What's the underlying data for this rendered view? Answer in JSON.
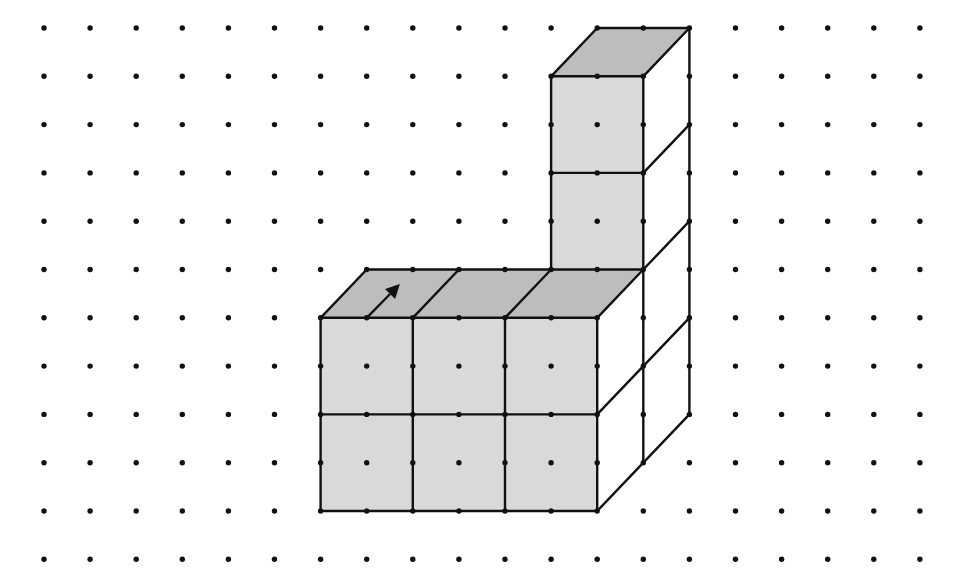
{
  "diagram": {
    "grid": {
      "origin_x": 44,
      "origin_y": 28,
      "col_spacing": 46.1,
      "row_spacing": 48.3,
      "cols": 20,
      "rows": 12,
      "dot_radius": 2.7,
      "dot_color": "#111111"
    },
    "colors": {
      "front_face": "#d9d9d9",
      "top_face": "#bdbdbd",
      "side_face": "#ffffff",
      "line": "#111111",
      "background": "#ffffff"
    },
    "line_width": 2.4,
    "polygons": [
      {
        "name": "column-top-face",
        "fill": "top_face",
        "points": [
          [
            12,
            0
          ],
          [
            14,
            0
          ],
          [
            13,
            1
          ],
          [
            11,
            1
          ]
        ]
      },
      {
        "name": "column-front-face",
        "fill": "front_face",
        "points": [
          [
            11,
            1
          ],
          [
            13,
            1
          ],
          [
            13,
            5
          ],
          [
            11,
            5
          ]
        ]
      },
      {
        "name": "column-right-face",
        "fill": "side_face",
        "points": [
          [
            13,
            1
          ],
          [
            14,
            0
          ],
          [
            14,
            8
          ],
          [
            13,
            9
          ]
        ]
      },
      {
        "name": "block-top-face",
        "fill": "top_face",
        "points": [
          [
            7,
            5
          ],
          [
            13,
            5
          ],
          [
            12,
            6
          ],
          [
            6,
            6
          ]
        ]
      },
      {
        "name": "block-front-face",
        "fill": "front_face",
        "points": [
          [
            6,
            6
          ],
          [
            12,
            6
          ],
          [
            12,
            10
          ],
          [
            6,
            10
          ]
        ]
      },
      {
        "name": "block-right-face",
        "fill": "side_face",
        "points": [
          [
            12,
            6
          ],
          [
            13,
            5
          ],
          [
            14,
            4
          ],
          [
            14,
            8
          ],
          [
            12,
            10
          ]
        ]
      }
    ],
    "lines": [
      [
        [
          12,
          0
        ],
        [
          14,
          0
        ]
      ],
      [
        [
          12,
          0
        ],
        [
          11,
          1
        ]
      ],
      [
        [
          14,
          0
        ],
        [
          13,
          1
        ]
      ],
      [
        [
          11,
          1
        ],
        [
          13,
          1
        ]
      ],
      [
        [
          11,
          1
        ],
        [
          11,
          5
        ]
      ],
      [
        [
          13,
          1
        ],
        [
          13,
          9
        ]
      ],
      [
        [
          14,
          0
        ],
        [
          14,
          8
        ]
      ],
      [
        [
          11,
          3
        ],
        [
          13,
          3
        ]
      ],
      [
        [
          13,
          3
        ],
        [
          14,
          2
        ]
      ],
      [
        [
          13,
          5
        ],
        [
          14,
          4
        ]
      ],
      [
        [
          7,
          5
        ],
        [
          13,
          5
        ]
      ],
      [
        [
          7,
          5
        ],
        [
          6,
          6
        ]
      ],
      [
        [
          9,
          5
        ],
        [
          8,
          6
        ]
      ],
      [
        [
          11,
          5
        ],
        [
          10,
          6
        ]
      ],
      [
        [
          13,
          5
        ],
        [
          12,
          6
        ]
      ],
      [
        [
          6,
          6
        ],
        [
          12,
          6
        ]
      ],
      [
        [
          6,
          6
        ],
        [
          6,
          10
        ]
      ],
      [
        [
          8,
          6
        ],
        [
          8,
          10
        ]
      ],
      [
        [
          10,
          6
        ],
        [
          10,
          10
        ]
      ],
      [
        [
          12,
          6
        ],
        [
          12,
          10
        ]
      ],
      [
        [
          6,
          8
        ],
        [
          12,
          8
        ]
      ],
      [
        [
          6,
          10
        ],
        [
          12,
          10
        ]
      ],
      [
        [
          12,
          8
        ],
        [
          14,
          6
        ]
      ],
      [
        [
          12,
          10
        ],
        [
          14,
          8
        ]
      ]
    ],
    "arrow": {
      "name": "direction-arrow",
      "from": [
        7,
        6
      ],
      "to": [
        7.72,
        5.3
      ],
      "color": "#111111"
    }
  }
}
